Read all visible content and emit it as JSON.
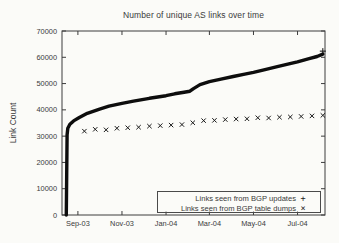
{
  "figure": {
    "background": "#fbfbf8",
    "frame_color": "#3c3c3c",
    "text_color": "#3a3a3a"
  },
  "chart_data": {
    "type": "line",
    "title": "Number of unique AS links over time",
    "xlabel": "",
    "ylabel": "Link Count",
    "ylim": [
      0,
      70000
    ],
    "xlim": [
      "2003-08-10",
      "2004-08-08"
    ],
    "grid": "off",
    "legend_position": "bottom-right-inside-box",
    "yticks": [
      {
        "label": "0",
        "value": 0
      },
      {
        "label": "10000",
        "value": 10000
      },
      {
        "label": "20000",
        "value": 20000
      },
      {
        "label": "30000",
        "value": 30000
      },
      {
        "label": "40000",
        "value": 40000
      },
      {
        "label": "50000",
        "value": 50000
      },
      {
        "label": "60000",
        "value": 60000
      },
      {
        "label": "70000",
        "value": 70000
      }
    ],
    "xticks": [
      {
        "label": "Sep-03",
        "date": "2003-09-01"
      },
      {
        "label": "Nov-03",
        "date": "2003-11-01"
      },
      {
        "label": "Jan-04",
        "date": "2004-01-01"
      },
      {
        "label": "Mar-04",
        "date": "2004-03-01"
      },
      {
        "label": "May-04",
        "date": "2004-05-01"
      },
      {
        "label": "Jul-04",
        "date": "2004-07-01"
      }
    ],
    "series": [
      {
        "name": "Links seen from BGP updates",
        "marker_glyph": "+",
        "style": "dense-points-thick-line",
        "color": "#0d0d0d",
        "points": [
          [
            "2003-08-16",
            0
          ],
          [
            "2003-08-17",
            30500
          ],
          [
            "2003-08-18",
            33000
          ],
          [
            "2003-08-21",
            34500
          ],
          [
            "2003-08-26",
            35800
          ],
          [
            "2003-09-03",
            37100
          ],
          [
            "2003-09-14",
            38700
          ],
          [
            "2003-10-01",
            40300
          ],
          [
            "2003-10-14",
            41400
          ],
          [
            "2003-11-01",
            42500
          ],
          [
            "2003-11-17",
            43300
          ],
          [
            "2003-12-09",
            44400
          ],
          [
            "2004-01-01",
            45400
          ],
          [
            "2004-01-13",
            46100
          ],
          [
            "2004-01-26",
            46700
          ],
          [
            "2004-02-03",
            47100
          ],
          [
            "2004-02-08",
            48100
          ],
          [
            "2004-02-17",
            49600
          ],
          [
            "2004-03-01",
            50700
          ],
          [
            "2004-03-17",
            51700
          ],
          [
            "2004-04-03",
            52700
          ],
          [
            "2004-04-19",
            53600
          ],
          [
            "2004-05-01",
            54300
          ],
          [
            "2004-05-17",
            55300
          ],
          [
            "2004-06-03",
            56400
          ],
          [
            "2004-06-19",
            57500
          ],
          [
            "2004-07-01",
            58300
          ],
          [
            "2004-07-17",
            59500
          ],
          [
            "2004-07-28",
            60300
          ],
          [
            "2004-08-05",
            61200
          ]
        ]
      },
      {
        "name": "Links seen from BGP table dumps",
        "marker_glyph": "×",
        "style": "points",
        "color": "#1a1a1a",
        "points": [
          [
            "2003-09-10",
            31900
          ],
          [
            "2003-09-25",
            32600
          ],
          [
            "2003-10-10",
            32400
          ],
          [
            "2003-10-25",
            33000
          ],
          [
            "2003-11-09",
            33200
          ],
          [
            "2003-11-24",
            33400
          ],
          [
            "2003-12-09",
            33800
          ],
          [
            "2003-12-24",
            34000
          ],
          [
            "2004-01-08",
            34200
          ],
          [
            "2004-01-23",
            34400
          ],
          [
            "2004-02-07",
            35100
          ],
          [
            "2004-02-22",
            35900
          ],
          [
            "2004-03-08",
            36000
          ],
          [
            "2004-03-23",
            36300
          ],
          [
            "2004-04-07",
            36500
          ],
          [
            "2004-04-22",
            36600
          ],
          [
            "2004-05-07",
            37000
          ],
          [
            "2004-05-22",
            36900
          ],
          [
            "2004-06-06",
            37200
          ],
          [
            "2004-06-21",
            37300
          ],
          [
            "2004-07-06",
            37500
          ],
          [
            "2004-07-21",
            37700
          ],
          [
            "2004-08-05",
            37900
          ]
        ]
      }
    ]
  }
}
